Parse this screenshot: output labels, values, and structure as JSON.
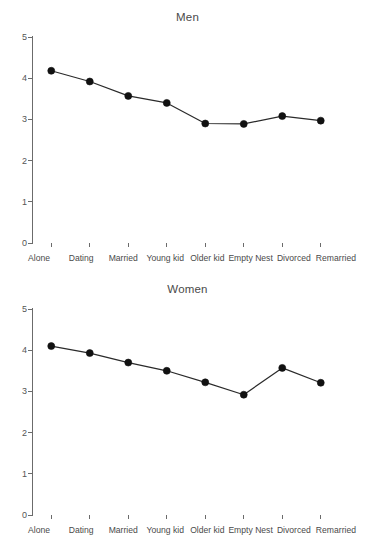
{
  "charts": [
    {
      "id": "men",
      "title": "Men",
      "yticks": [
        "5",
        "4",
        "3",
        "2",
        "1",
        "0"
      ]
    },
    {
      "id": "women",
      "title": "Women",
      "yticks": [
        "5",
        "4",
        "3",
        "2",
        "1",
        "0"
      ]
    }
  ],
  "xlabels": [
    "Alone",
    "Dating",
    "Married",
    "Young kid",
    "Older kid",
    "Empty Nest",
    "Divorced",
    "Remarried"
  ],
  "colors": {
    "axis": "#6b6b6b",
    "gridline": "#8a8a8a",
    "gridline_green": "#7fd4a0",
    "gridline_purple": "#b08ac9",
    "gridline_magenta": "#e85fe0",
    "gridline_blue": "#9aa4d8",
    "series_line": "#2a2a2a",
    "marker": "#111111",
    "text": "#4a4a4a"
  },
  "chart_data": [
    {
      "type": "line",
      "title": "Men",
      "xlabel": "",
      "ylabel": "",
      "categories": [
        "Alone",
        "Dating",
        "Married",
        "Young kid",
        "Older kid",
        "Empty Nest",
        "Divorced",
        "Remarried"
      ],
      "values": [
        4.18,
        3.92,
        3.57,
        3.4,
        2.9,
        2.89,
        3.08,
        2.97
      ],
      "ylim": [
        0,
        5
      ],
      "yticks": [
        0,
        1,
        2,
        3,
        4,
        5
      ],
      "grid": true,
      "legend": "none",
      "markers": "filled-circle"
    },
    {
      "type": "line",
      "title": "Women",
      "xlabel": "",
      "ylabel": "",
      "categories": [
        "Alone",
        "Dating",
        "Married",
        "Young kid",
        "Older kid",
        "Empty Nest",
        "Divorced",
        "Remarried"
      ],
      "values": [
        4.1,
        3.93,
        3.7,
        3.5,
        3.22,
        2.92,
        3.57,
        3.21
      ],
      "ylim": [
        0,
        5
      ],
      "yticks": [
        0,
        1,
        2,
        3,
        4,
        5
      ],
      "grid": true,
      "legend": "none",
      "markers": "filled-circle"
    }
  ]
}
